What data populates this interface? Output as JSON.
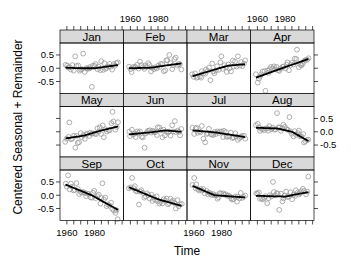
{
  "chart_data": {
    "type": "scatter",
    "layout": "lattice-4x3",
    "title": "",
    "xlabel": "Time",
    "ylabel": "Centered Seasonal + Remainder",
    "xlim": [
      1955,
      2001
    ],
    "ylim": [
      -0.95,
      0.95
    ],
    "x_ticks": [
      1960,
      1965,
      1970,
      1975,
      1980,
      1985,
      1990,
      1995,
      2000
    ],
    "x_tick_labels": [
      "1960",
      "1980"
    ],
    "y_ticks": [
      -0.5,
      0.0,
      0.5
    ],
    "y_tick_labels": [
      "-0.5",
      "0.0",
      "0.5"
    ],
    "grid": false,
    "years": {
      "start": 1959,
      "end": 1997
    },
    "panels": [
      {
        "month": "Jan",
        "trend": [
          [
            1959,
            0.02
          ],
          [
            1970,
            0.0
          ],
          [
            1980,
            0.0
          ],
          [
            1997,
            0.12
          ]
        ],
        "spread": 0.18,
        "outliers": [
          [
            1972,
            0.55
          ],
          [
            1978,
            -0.7
          ],
          [
            1966,
            0.45
          ]
        ]
      },
      {
        "month": "Feb",
        "trend": [
          [
            1959,
            0.0
          ],
          [
            1975,
            0.02
          ],
          [
            1985,
            0.1
          ],
          [
            1997,
            0.18
          ]
        ],
        "spread": 0.16,
        "outliers": [
          [
            1988,
            0.5
          ],
          [
            1993,
            0.4
          ]
        ]
      },
      {
        "month": "Mar",
        "trend": [
          [
            1959,
            -0.3
          ],
          [
            1975,
            -0.05
          ],
          [
            1985,
            0.1
          ],
          [
            1997,
            0.15
          ]
        ],
        "spread": 0.2,
        "outliers": [
          [
            1980,
            0.45
          ],
          [
            1992,
            0.45
          ],
          [
            1972,
            -0.45
          ]
        ]
      },
      {
        "month": "Apr",
        "trend": [
          [
            1959,
            -0.35
          ],
          [
            1975,
            -0.05
          ],
          [
            1997,
            0.35
          ]
        ],
        "spread": 0.18,
        "outliers": [
          [
            1989,
            0.7
          ],
          [
            1966,
            -0.85
          ]
        ]
      },
      {
        "month": "May",
        "trend": [
          [
            1959,
            -0.25
          ],
          [
            1972,
            -0.15
          ],
          [
            1985,
            0.05
          ],
          [
            1997,
            0.2
          ]
        ],
        "spread": 0.18,
        "outliers": [
          [
            1993,
            0.75
          ],
          [
            1962,
            0.35
          ],
          [
            1966,
            -0.6
          ]
        ]
      },
      {
        "month": "Jun",
        "trend": [
          [
            1959,
            -0.1
          ],
          [
            1975,
            -0.02
          ],
          [
            1985,
            0.05
          ],
          [
            1997,
            0.0
          ]
        ],
        "spread": 0.18,
        "outliers": [
          [
            1992,
            0.4
          ],
          [
            1970,
            -0.6
          ]
        ]
      },
      {
        "month": "Jul",
        "trend": [
          [
            1959,
            0.05
          ],
          [
            1975,
            -0.02
          ],
          [
            1997,
            -0.2
          ]
        ],
        "spread": 0.16,
        "outliers": [
          [
            1968,
            -0.4
          ]
        ]
      },
      {
        "month": "Aug",
        "trend": [
          [
            1959,
            0.15
          ],
          [
            1975,
            0.12
          ],
          [
            1985,
            0.0
          ],
          [
            1997,
            -0.35
          ]
        ],
        "spread": 0.15,
        "outliers": [
          [
            1974,
            0.7
          ],
          [
            1983,
            0.55
          ]
        ]
      },
      {
        "month": "Sep",
        "trend": [
          [
            1959,
            0.4
          ],
          [
            1978,
            0.0
          ],
          [
            1997,
            -0.55
          ]
        ],
        "spread": 0.2,
        "outliers": [
          [
            1986,
            0.45
          ],
          [
            1997,
            -0.9
          ],
          [
            1961,
            0.75
          ]
        ]
      },
      {
        "month": "Oct",
        "trend": [
          [
            1959,
            0.3
          ],
          [
            1980,
            -0.15
          ],
          [
            1997,
            -0.4
          ]
        ],
        "spread": 0.17,
        "outliers": [
          [
            1961,
            0.65
          ],
          [
            1966,
            -0.35
          ]
        ]
      },
      {
        "month": "Nov",
        "trend": [
          [
            1959,
            0.35
          ],
          [
            1975,
            0.0
          ],
          [
            1997,
            -0.08
          ]
        ],
        "spread": 0.14,
        "outliers": [
          [
            1960,
            0.65
          ]
        ]
      },
      {
        "month": "Dec",
        "trend": [
          [
            1959,
            -0.02
          ],
          [
            1980,
            -0.05
          ],
          [
            1997,
            0.12
          ]
        ],
        "spread": 0.16,
        "outliers": [
          [
            1971,
            0.5
          ],
          [
            1997,
            0.7
          ],
          [
            1976,
            -0.55
          ],
          [
            1967,
            -0.3
          ]
        ]
      }
    ]
  }
}
